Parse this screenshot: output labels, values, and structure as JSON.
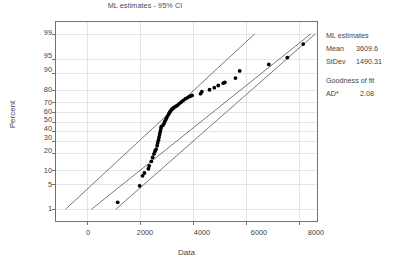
{
  "chart_data": {
    "type": "scatter",
    "title": "",
    "subtitle": "ML estimates - 95% CI",
    "xlabel": "Data",
    "ylabel": "Percent",
    "grid": true,
    "xlim": [
      -1200,
      8700
    ],
    "xticks": [
      "0",
      "2000",
      "4000",
      "6000",
      "8000"
    ],
    "xtick_values": [
      0,
      2000,
      4000,
      6000,
      8000
    ],
    "yticks": [
      "99",
      "95",
      "90",
      "80",
      "70",
      "60",
      "50",
      "40",
      "30",
      "20",
      "10",
      "5",
      "1"
    ],
    "ytick_values": [
      99,
      95,
      90,
      80,
      70,
      60,
      50,
      40,
      30,
      20,
      10,
      5,
      1
    ],
    "scale": "normal-probability",
    "points": [
      [
        1150,
        1.6
      ],
      [
        1980,
        4.4
      ],
      [
        2090,
        7.5
      ],
      [
        2160,
        8.6
      ],
      [
        2310,
        10.5
      ],
      [
        2340,
        12.0
      ],
      [
        2420,
        14.5
      ],
      [
        2470,
        17.0
      ],
      [
        2520,
        19.5
      ],
      [
        2560,
        21.5
      ],
      [
        2600,
        23.0
      ],
      [
        2640,
        26.0
      ],
      [
        2660,
        28.5
      ],
      [
        2690,
        31.0
      ],
      [
        2710,
        33.5
      ],
      [
        2730,
        36.0
      ],
      [
        2750,
        38.5
      ],
      [
        2770,
        41.0
      ],
      [
        2790,
        43.5
      ],
      [
        2800,
        44.5
      ],
      [
        2860,
        46.0
      ],
      [
        2900,
        48.0
      ],
      [
        2930,
        50.0
      ],
      [
        2970,
        52.0
      ],
      [
        3000,
        54.0
      ],
      [
        3040,
        56.0
      ],
      [
        3080,
        58.0
      ],
      [
        3110,
        59.5
      ],
      [
        3150,
        61.0
      ],
      [
        3190,
        62.5
      ],
      [
        3230,
        63.5
      ],
      [
        3280,
        64.5
      ],
      [
        3340,
        65.5
      ],
      [
        3400,
        66.5
      ],
      [
        3470,
        68.0
      ],
      [
        3540,
        69.5
      ],
      [
        3620,
        71.0
      ],
      [
        3700,
        72.5
      ],
      [
        3780,
        73.5
      ],
      [
        3850,
        74.5
      ],
      [
        3900,
        75.0
      ],
      [
        3960,
        75.5
      ],
      [
        4280,
        77.0
      ],
      [
        4330,
        78.5
      ],
      [
        4620,
        80.0
      ],
      [
        4800,
        81.5
      ],
      [
        4950,
        83.0
      ],
      [
        5140,
        84.5
      ],
      [
        5200,
        85.0
      ],
      [
        5600,
        87.5
      ],
      [
        5760,
        91.0
      ],
      [
        6860,
        93.5
      ],
      [
        7560,
        95.5
      ],
      [
        8160,
        98.0
      ]
    ],
    "fit_line": {
      "name": "ML fit",
      "x": [
        160,
        8450
      ],
      "y": [
        1,
        99
      ]
    },
    "ci_upper": {
      "name": "95% CI upper",
      "x": [
        -820,
        6330
      ],
      "y": [
        1,
        99
      ]
    },
    "ci_lower": {
      "name": "95% CI lower",
      "x": [
        1080,
        8620
      ],
      "y": [
        1,
        99
      ]
    },
    "annotations": {
      "ml_header": "ML estimates",
      "mean_label": "Mean",
      "mean_value": "3609.6",
      "stdev_label": "StDev",
      "stdev_value": "1490.31",
      "gof_header": "Goodness of fit",
      "ad_label": "AD*",
      "ad_value": "2.08"
    },
    "colors": {
      "point": "#000000",
      "line": "#555555",
      "grid": "#dadada",
      "frame": "#707070",
      "text": "#3f3f3f",
      "background": "#ffffff"
    }
  }
}
